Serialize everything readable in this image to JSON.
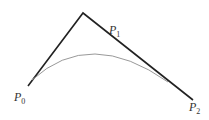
{
  "diagram": {
    "type": "quadratic-bezier",
    "points": [
      {
        "name": "P",
        "sub": "0",
        "x": 28,
        "y": 86
      },
      {
        "name": "P",
        "sub": "1",
        "x": 83,
        "y": 13
      },
      {
        "name": "P",
        "sub": "2",
        "x": 193,
        "y": 100
      }
    ],
    "colors": {
      "polygon": "#222222",
      "curve": "#999999"
    }
  }
}
